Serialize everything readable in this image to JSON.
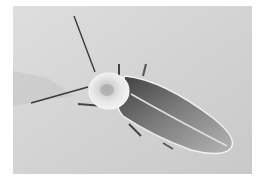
{
  "image": {
    "subject": "firefly beetle on light surface",
    "alt": "Photograph of a firefly beetle viewed from above, on a pale gray background"
  },
  "colors": {
    "background": "#ffffff",
    "surface": "#d4d4d4",
    "surface_shadow": "#bdbdbd",
    "body_dark": "#4a4a4a",
    "body_mid": "#8a8a8a",
    "pronotum": "#e6e6e6",
    "elytra_edge": "#f0f0f0"
  }
}
